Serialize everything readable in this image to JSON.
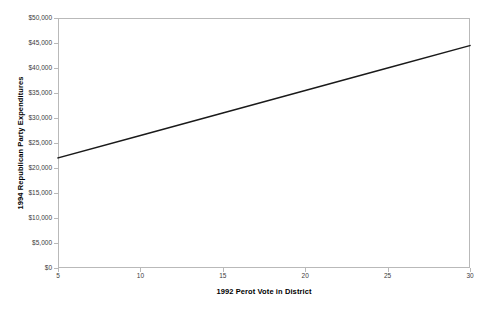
{
  "chart_data": {
    "type": "line",
    "title": "",
    "xlabel": "1992 Perot Vote in District",
    "ylabel": "1994 Republican Party Expenditures",
    "xlim": [
      5,
      30
    ],
    "ylim": [
      0,
      50000
    ],
    "grid": false,
    "legend": "none",
    "x_ticks": [
      5,
      10,
      15,
      20,
      25,
      30
    ],
    "x_tick_labels": [
      "5",
      "10",
      "15",
      "20",
      "25",
      "30"
    ],
    "y_ticks": [
      0,
      5000,
      10000,
      15000,
      20000,
      25000,
      30000,
      35000,
      40000,
      45000,
      50000
    ],
    "y_tick_labels": [
      "$0",
      "$5,000",
      "$10,000",
      "$15,000",
      "$20,000",
      "$25,000",
      "$30,000",
      "$35,000",
      "$40,000",
      "$45,000",
      "$50,000"
    ],
    "series": [
      {
        "name": "Predicted 1994 Republican Party Expenditures",
        "color": "#1a1a1a",
        "x": [
          5,
          10,
          15,
          20,
          25,
          30
        ],
        "values": [
          22000,
          26500,
          31000,
          35500,
          40000,
          44500
        ]
      }
    ],
    "line_color": "#1a1a1a",
    "axis_color": "#b9b9b9",
    "background_color": "#ffffff"
  }
}
